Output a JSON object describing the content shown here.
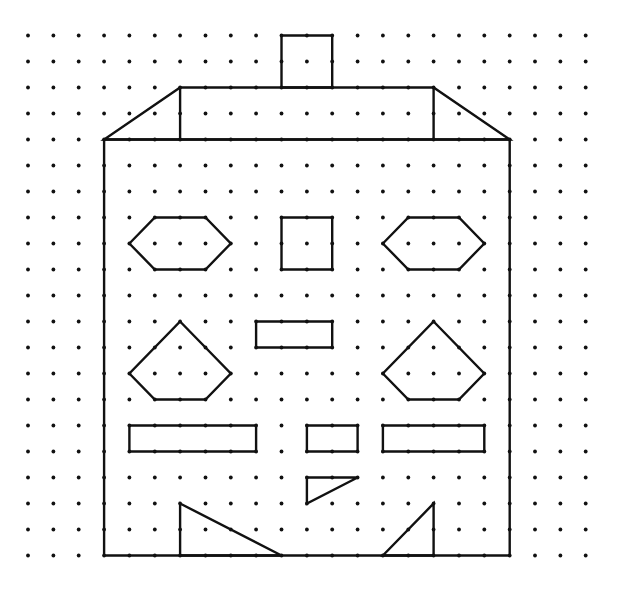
{
  "diagram": {
    "type": "dot-grid-drawing",
    "grid": {
      "columns": 23,
      "rows": 21,
      "origin_x": 28,
      "origin_y": 35.5,
      "spacing_x": 25.35,
      "spacing_y": 26.0,
      "dot_radius": 1.9,
      "dot_color": "#111111"
    },
    "stroke_color": "#111111",
    "shapes": [
      {
        "name": "chimney",
        "kind": "polygon",
        "points": [
          [
            10,
            0
          ],
          [
            12,
            0
          ],
          [
            12,
            2
          ],
          [
            10,
            2
          ]
        ]
      },
      {
        "name": "roof-trapezoid",
        "kind": "polygon",
        "points": [
          [
            6,
            2
          ],
          [
            16,
            2
          ],
          [
            19,
            4
          ],
          [
            3,
            4
          ]
        ]
      },
      {
        "name": "roof-left-divider",
        "kind": "line",
        "points": [
          [
            6,
            2
          ],
          [
            6,
            4
          ]
        ]
      },
      {
        "name": "roof-right-divider",
        "kind": "line",
        "points": [
          [
            16,
            2
          ],
          [
            16,
            4
          ]
        ]
      },
      {
        "name": "house-body",
        "kind": "polygon",
        "points": [
          [
            3,
            4
          ],
          [
            19,
            4
          ],
          [
            19,
            20
          ],
          [
            3,
            20
          ]
        ]
      },
      {
        "name": "left-eye-hexagon",
        "kind": "polygon",
        "points": [
          [
            4,
            8
          ],
          [
            5,
            7
          ],
          [
            7,
            7
          ],
          [
            8,
            8
          ],
          [
            7,
            9
          ],
          [
            5,
            9
          ]
        ]
      },
      {
        "name": "center-square",
        "kind": "polygon",
        "points": [
          [
            10,
            7
          ],
          [
            12,
            7
          ],
          [
            12,
            9
          ],
          [
            10,
            9
          ]
        ]
      },
      {
        "name": "right-eye-hexagon",
        "kind": "polygon",
        "points": [
          [
            14,
            8
          ],
          [
            15,
            7
          ],
          [
            17,
            7
          ],
          [
            18,
            8
          ],
          [
            17,
            9
          ],
          [
            15,
            9
          ]
        ]
      },
      {
        "name": "left-pentagon",
        "kind": "polygon",
        "points": [
          [
            6,
            11
          ],
          [
            8,
            13
          ],
          [
            7,
            14
          ],
          [
            5,
            14
          ],
          [
            4,
            13
          ]
        ]
      },
      {
        "name": "nose-rectangle",
        "kind": "polygon",
        "points": [
          [
            9,
            11
          ],
          [
            12,
            11
          ],
          [
            12,
            12
          ],
          [
            9,
            12
          ]
        ]
      },
      {
        "name": "right-pentagon",
        "kind": "polygon",
        "points": [
          [
            16,
            11
          ],
          [
            18,
            13
          ],
          [
            17,
            14
          ],
          [
            15,
            14
          ],
          [
            14,
            13
          ]
        ]
      },
      {
        "name": "left-bar",
        "kind": "polygon",
        "points": [
          [
            4,
            15
          ],
          [
            9,
            15
          ],
          [
            9,
            16
          ],
          [
            4,
            16
          ]
        ]
      },
      {
        "name": "middle-bar",
        "kind": "polygon",
        "points": [
          [
            11,
            15
          ],
          [
            13,
            15
          ],
          [
            13,
            16
          ],
          [
            11,
            16
          ]
        ]
      },
      {
        "name": "right-bar",
        "kind": "polygon",
        "points": [
          [
            14,
            15
          ],
          [
            18,
            15
          ],
          [
            18,
            16
          ],
          [
            14,
            16
          ]
        ]
      },
      {
        "name": "mouth-triangle",
        "kind": "polygon",
        "points": [
          [
            11,
            17
          ],
          [
            13,
            17
          ],
          [
            11,
            18
          ]
        ]
      },
      {
        "name": "left-foot-triangle",
        "kind": "polygon",
        "points": [
          [
            6,
            18
          ],
          [
            10,
            20
          ],
          [
            6,
            20
          ]
        ]
      },
      {
        "name": "right-foot-triangle",
        "kind": "polygon",
        "points": [
          [
            16,
            18
          ],
          [
            16,
            20
          ],
          [
            14,
            20
          ]
        ]
      }
    ]
  }
}
